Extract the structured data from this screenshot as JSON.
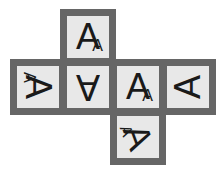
{
  "diagram": {
    "type": "cube-net",
    "border_color": "#666666",
    "face_color": "#e8e8e8",
    "faces": [
      {
        "id": "top",
        "letter": "A",
        "sub": "A",
        "rotation": 0,
        "mirror": false,
        "has_sub": true
      },
      {
        "id": "left",
        "letter": "A",
        "sub": "A",
        "rotation": 90,
        "mirror": true,
        "has_sub": true
      },
      {
        "id": "center-left",
        "letter": "A",
        "sub": "",
        "rotation": 180,
        "mirror": true,
        "has_sub": false
      },
      {
        "id": "center-right",
        "letter": "A",
        "sub": "A",
        "rotation": 0,
        "mirror": false,
        "has_sub": true
      },
      {
        "id": "right",
        "letter": "A",
        "sub": "",
        "rotation": -90,
        "mirror": false,
        "has_sub": false
      },
      {
        "id": "bottom",
        "letter": "A",
        "sub": "A",
        "rotation": 70,
        "mirror": true,
        "has_sub": true
      }
    ]
  }
}
